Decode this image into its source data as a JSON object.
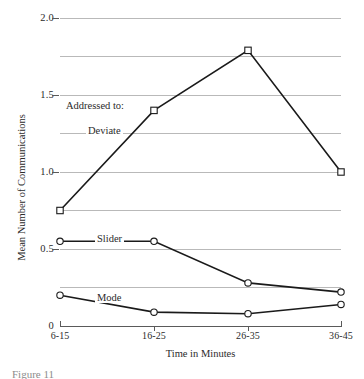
{
  "chart_data": {
    "type": "line",
    "title": "",
    "xlabel": "Time in Minutes",
    "ylabel": "Mean Number of Communications",
    "categories": [
      "6-15",
      "16-25",
      "26-35",
      "36-45"
    ],
    "ylim": [
      0,
      2.0
    ],
    "ytick_labels": [
      "0",
      "0.5",
      "1.0",
      "1.5",
      "2.0"
    ],
    "ytick_values": [
      0,
      0.5,
      1.0,
      1.5,
      2.0
    ],
    "gridlines": [
      0.25,
      0.5,
      0.75,
      1.0,
      1.25,
      1.5,
      1.75,
      2.0
    ],
    "grid": true,
    "legend_position": "inline-labels",
    "series": [
      {
        "name": "Deviate",
        "marker": "open-square",
        "values": [
          0.75,
          1.4,
          1.79,
          1.0
        ]
      },
      {
        "name": "Slider",
        "marker": "open-circle",
        "values": [
          0.55,
          0.55,
          0.28,
          0.22
        ]
      },
      {
        "name": "Mode",
        "marker": "open-circle",
        "values": [
          0.2,
          0.09,
          0.08,
          0.14
        ]
      }
    ],
    "annotations": [
      {
        "text": "Addressed to:",
        "x_frac": 0.05,
        "y_value": 1.4
      },
      {
        "text": "Deviate",
        "x_frac": 0.22,
        "y_value": 1.24
      },
      {
        "text": "Slider",
        "x_frac": 0.3,
        "y_value": 0.6
      },
      {
        "text": "Mode",
        "x_frac": 0.3,
        "y_value": 0.23
      }
    ]
  },
  "axes": {
    "x_title": "Time in Minutes",
    "y_title": "Mean Number of Communications",
    "x_ticks": [
      "6-15",
      "16-25",
      "26-35",
      "36-45"
    ],
    "y_ticks": [
      "2.0",
      "1.5",
      "1.0",
      "0.5",
      "0"
    ]
  },
  "labels": {
    "addressed_to": "Addressed to:",
    "deviate": "Deviate",
    "slider": "Slider",
    "mode": "Mode"
  },
  "caption": {
    "text": "Figure 11"
  },
  "colors": {
    "line": "#1a1a1a",
    "grid": "#b9b9b9",
    "axis": "#5a5a5a",
    "text": "#2b2b2b",
    "background": "#ffffff"
  }
}
